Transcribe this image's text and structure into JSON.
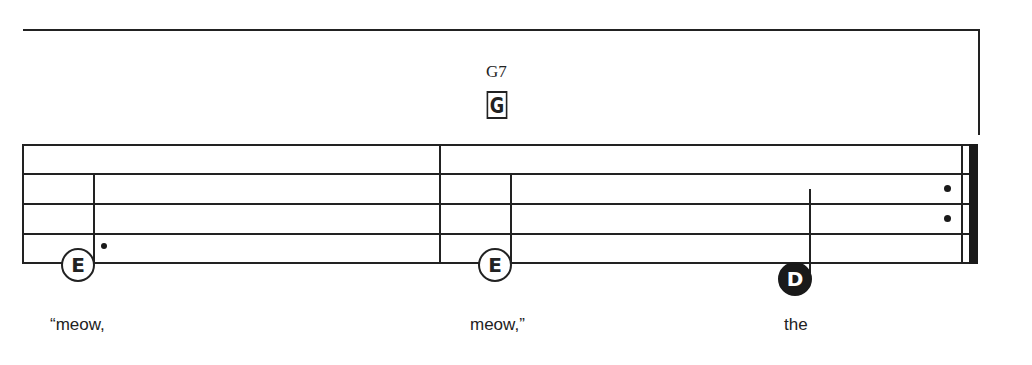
{
  "chord": {
    "name": "G7",
    "box_letter": "G"
  },
  "staff": {
    "line_count": 5,
    "color": "#222222"
  },
  "notes": [
    {
      "letter": "E",
      "style": "open",
      "dotted": true
    },
    {
      "letter": "E",
      "style": "open",
      "dotted": false
    },
    {
      "letter": "D",
      "style": "filled",
      "dotted": false
    }
  ],
  "lyrics": [
    {
      "text": "“meow,"
    },
    {
      "text": "meow,”"
    },
    {
      "text": "the"
    }
  ],
  "ending": {
    "type": "repeat-end"
  }
}
